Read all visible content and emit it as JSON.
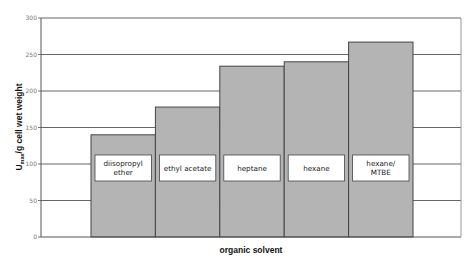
{
  "chart_data": {
    "type": "bar",
    "title": "",
    "xlabel": "organic solvent",
    "ylabel": "U_max/g cell wet weight",
    "ylabel_main": "U",
    "ylabel_sub": "max",
    "ylabel_rest": "/g cell wet weight",
    "ylim": [
      0,
      300
    ],
    "yticks": [
      0,
      50,
      100,
      150,
      200,
      250,
      300
    ],
    "grid": true,
    "legend": "none",
    "categories": [
      "diisopropyl ether",
      "ethyl acetate",
      "heptane",
      "hexane",
      "hexane/MTBE"
    ],
    "category_lines": [
      [
        "diisopropyl",
        "ether"
      ],
      [
        "ethyl acetate"
      ],
      [
        "heptane"
      ],
      [
        "hexane"
      ],
      [
        "hexane/",
        "MTBE"
      ]
    ],
    "values": [
      140,
      178,
      234,
      240,
      267
    ],
    "colors": {
      "bar_fill": "#b4b4b4",
      "bar_stroke": "#444444",
      "grid": "#555555"
    }
  }
}
